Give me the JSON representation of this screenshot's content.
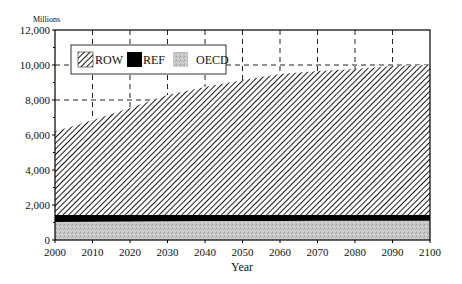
{
  "chart_data": {
    "type": "area",
    "stacked": true,
    "title": "",
    "unit_label": "Millions",
    "xlabel": "Year",
    "ylabel": "",
    "xlim": [
      2000,
      2100
    ],
    "ylim": [
      0,
      12000
    ],
    "x_ticks": [
      2000,
      2010,
      2020,
      2030,
      2040,
      2050,
      2060,
      2070,
      2080,
      2090,
      2100
    ],
    "y_ticks": [
      0,
      2000,
      4000,
      6000,
      8000,
      10000,
      12000
    ],
    "y_tick_labels": [
      "0",
      "2,000",
      "4,000",
      "6,000",
      "8,000",
      "10,000",
      "12,000"
    ],
    "grid": "dashed, behind data",
    "legend_position": "upper left, inside plot",
    "x": [
      2000,
      2010,
      2020,
      2030,
      2040,
      2050,
      2060,
      2070,
      2080,
      2090,
      2100
    ],
    "series": [
      {
        "name": "OECD",
        "pattern": "light gray stipple",
        "values": [
          1030,
          1040,
          1060,
          1070,
          1080,
          1090,
          1090,
          1100,
          1100,
          1100,
          1100
        ]
      },
      {
        "name": "REF",
        "pattern": "solid black",
        "values": [
          400,
          390,
          380,
          370,
          360,
          360,
          350,
          350,
          350,
          350,
          350
        ]
      },
      {
        "name": "ROW",
        "pattern": "diagonal hatch",
        "values": [
          4770,
          5420,
          6110,
          6840,
          7300,
          7690,
          8050,
          8210,
          8320,
          8490,
          8550
        ]
      }
    ],
    "stacked_totals": [
      6200,
      6850,
      7550,
      8280,
      8740,
      9140,
      9490,
      9660,
      9770,
      9940,
      10000
    ]
  },
  "legend": {
    "items": [
      {
        "label": "ROW"
      },
      {
        "label": "REF"
      },
      {
        "label": "OECD"
      }
    ]
  },
  "colors": {
    "oecd_fill": "#c4c4c4",
    "ref_fill": "#000000",
    "row_hatch": "#1a1a1a",
    "grid": "#222222",
    "axis": "#000000"
  }
}
